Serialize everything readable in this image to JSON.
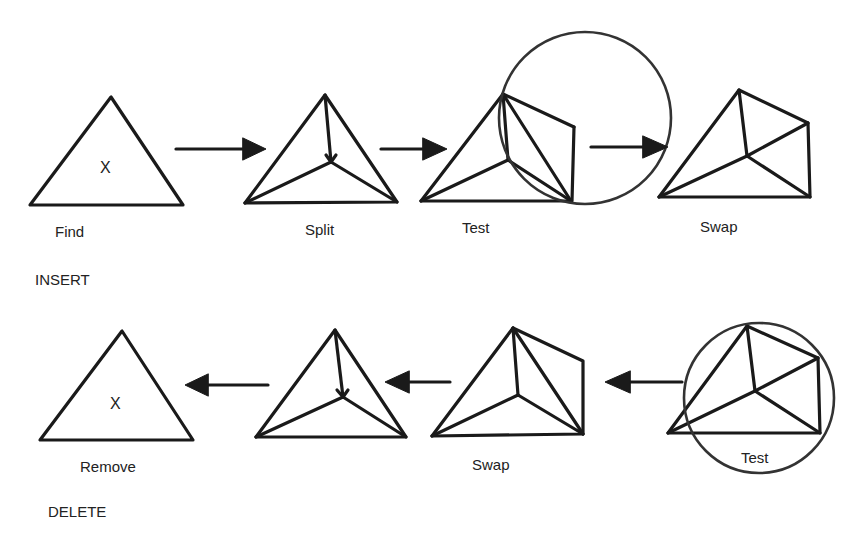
{
  "colors": {
    "stroke": "#1a1a1a",
    "circle": "#333333",
    "text": "#222222",
    "background": "#ffffff"
  },
  "sections": {
    "insert": {
      "label": "INSERT"
    },
    "delete": {
      "label": "DELETE"
    }
  },
  "insert_row": {
    "steps": [
      {
        "label": "Find",
        "marker": "X"
      },
      {
        "label": "Split"
      },
      {
        "label": "Test"
      },
      {
        "label": "Swap"
      }
    ],
    "arrows": [
      "find-to-split",
      "split-to-test",
      "test-to-swap"
    ],
    "arrow_direction": "right"
  },
  "delete_row": {
    "steps": [
      {
        "label": "Test"
      },
      {
        "label": "Swap"
      },
      {
        "label": "Split-reverse"
      },
      {
        "label": "Remove",
        "marker": "X"
      }
    ],
    "arrows": [
      "test-to-swap",
      "swap-to-merge",
      "merge-to-remove"
    ],
    "arrow_direction": "left"
  }
}
